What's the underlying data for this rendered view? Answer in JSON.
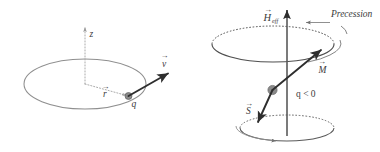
{
  "figure": {
    "title": "",
    "background_color": "#ffffff",
    "width": 380,
    "height": 152,
    "panels": [
      {
        "id": "left-panel",
        "name": "charge-orbiting-in-plane",
        "labels": {
          "axis_z": "z",
          "position_vector": "r",
          "velocity_vector": "v",
          "charge": "q"
        }
      },
      {
        "id": "right-panel",
        "name": "larmor-precession",
        "labels": {
          "field_vector": "H",
          "field_subscript": "eff",
          "precession": "Precession",
          "magnetization_vector": "M",
          "spin_vector": "S",
          "charge_sign": "q < 0"
        }
      }
    ]
  },
  "colors": {
    "ink": "#3a3a3a",
    "line_dark": "#4a4a4a",
    "line_mid": "#7d7d7d",
    "line_light": "#a8a8a8",
    "dot_fill": "#8a8a8a",
    "dot_stroke": "#5e5e5e",
    "arrow_dark": "#2e2e2e"
  }
}
